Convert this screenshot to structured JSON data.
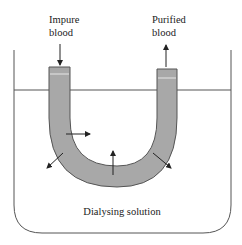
{
  "diagram": {
    "labels": {
      "inlet_line1": "Impure",
      "inlet_line2": "blood",
      "outlet_line1": "Purified",
      "outlet_line2": "blood",
      "solution": "Dialysing solution"
    },
    "colors": {
      "tube_fill": "#a8a8a8",
      "outline": "#555555",
      "arrow": "#222222",
      "background": "#ffffff"
    },
    "arrows": [
      {
        "name": "inflow-arrow",
        "meaning": "impure blood enters"
      },
      {
        "name": "outflow-arrow",
        "meaning": "purified blood exits"
      },
      {
        "name": "diffusion-arrow-right",
        "meaning": "diffusion across membrane"
      },
      {
        "name": "diffusion-arrow-up",
        "meaning": "diffusion across membrane"
      },
      {
        "name": "diffusion-arrow-down-left",
        "meaning": "diffusion into solution"
      },
      {
        "name": "diffusion-arrow-down-right",
        "meaning": "diffusion into solution"
      }
    ]
  }
}
